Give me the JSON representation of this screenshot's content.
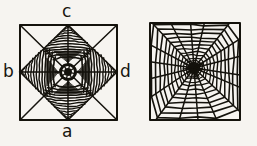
{
  "figure": {
    "caption": "",
    "background_color": "#f6f4f0",
    "ink_color": "#14120c"
  },
  "labels": {
    "top": "c",
    "bottom": "a",
    "left": "b",
    "right": "d"
  },
  "panels": [
    {
      "id": "left-web",
      "name": "abnormal-four-point-star-web",
      "description": "Square frame with diagonals and median cross; four dense zigzag wedges forming a four-pointed star around a dark central hub",
      "frame": {
        "x": 20,
        "y": 25,
        "width": 97,
        "height": 95
      },
      "hub": {
        "cx": 68,
        "cy": 72,
        "r": 9
      },
      "radial_spokes": 8,
      "wedges": 4,
      "wedge_zigzag_rows": 14
    },
    {
      "id": "right-web",
      "name": "normal-orb-web",
      "description": "Square frame containing a regular orb web: concentric spiral rings crossed by radial spokes converging on an off-center dark hub",
      "frame": {
        "x": 150,
        "y": 23,
        "width": 90,
        "height": 97
      },
      "hub": {
        "cx": 194,
        "cy": 68,
        "r": 5
      },
      "radial_spokes": 18,
      "spiral_rings": 11
    }
  ],
  "chart_data": {
    "type": "diagram",
    "title": "",
    "xlabel": "",
    "ylabel": "",
    "series": [
      {
        "name": "abnormal web (left)",
        "values": [
          4,
          8,
          14
        ]
      },
      {
        "name": "normal orb web (right)",
        "values": [
          18,
          11
        ]
      }
    ]
  }
}
